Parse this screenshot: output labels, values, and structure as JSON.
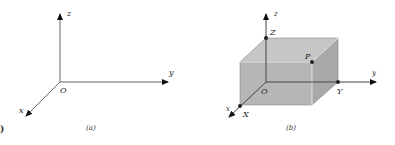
{
  "figure_a": {
    "caption": "(a)",
    "labels": {
      "z": "z",
      "y": "y",
      "x": "x",
      "origin": "O"
    }
  },
  "figure_b": {
    "caption": "(b)",
    "labels": {
      "z": "z",
      "y": "y",
      "x": "x",
      "origin": "O",
      "point_Z": "Z",
      "point_P": "P",
      "point_Y": "Y",
      "point_X": "X"
    }
  },
  "colors": {
    "box_fill": "#b4b4b4",
    "box_top": "#c4c4c4",
    "box_side": "#a8a8a8",
    "axis": "#555555",
    "edge": "#8a8a8a"
  },
  "stray_mark": ")"
}
